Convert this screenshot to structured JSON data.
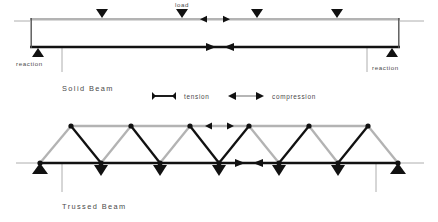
{
  "figure": {
    "title_present": false,
    "background_color": "#ffffff",
    "colors": {
      "tension": "#111111",
      "compression": "#b3b3b3",
      "ground_line": "#9a9a9a",
      "text": "#4a4a4a"
    }
  },
  "solid_beam": {
    "caption": "Solid Beam",
    "load_label": "load",
    "reaction_label_left": "reaction",
    "reaction_label_right": "reaction",
    "geometry": {
      "x_left": 30,
      "x_right": 400,
      "y_top": 18,
      "y_bottom": 48
    },
    "loads": [
      {
        "x": 102,
        "label": ""
      },
      {
        "x": 182,
        "label": "load"
      },
      {
        "x": 257,
        "label": ""
      },
      {
        "x": 337,
        "label": ""
      }
    ],
    "reactions": [
      {
        "x": 38,
        "label": "reaction"
      },
      {
        "x": 392,
        "label": "reaction"
      }
    ],
    "force_indicators": [
      {
        "chord": "top",
        "type": "compression",
        "x_center": 215,
        "direction": "outward"
      },
      {
        "chord": "bottom",
        "type": "tension",
        "x_center": 215,
        "direction": "inward"
      }
    ]
  },
  "legend": {
    "items": [
      {
        "label": "tension",
        "type": "tension",
        "color": "#111111",
        "arrow_style": "inward"
      },
      {
        "label": "compression",
        "type": "compression",
        "color": "#b3b3b3",
        "arrow_style": "outward"
      }
    ]
  },
  "trussed_beam": {
    "caption": "Trussed Beam",
    "geometry": {
      "y_top_chord": 126,
      "y_bottom_chord": 163,
      "x_left_support": 40,
      "x_right_support": 398
    },
    "top_nodes_x": [
      71,
      131,
      190,
      249,
      309,
      368
    ],
    "bottom_nodes_x": [
      40,
      101,
      160,
      219,
      279,
      338,
      398
    ],
    "top_chord_type": "compression",
    "bottom_chord_type": "tension",
    "diagonals": [
      {
        "from_x": 40,
        "to_x": 71,
        "type": "compression"
      },
      {
        "from_x": 71,
        "to_x": 101,
        "type": "tension"
      },
      {
        "from_x": 101,
        "to_x": 131,
        "type": "compression"
      },
      {
        "from_x": 131,
        "to_x": 160,
        "type": "tension"
      },
      {
        "from_x": 160,
        "to_x": 190,
        "type": "compression"
      },
      {
        "from_x": 190,
        "to_x": 219,
        "type": "tension"
      },
      {
        "from_x": 219,
        "to_x": 249,
        "type": "tension"
      },
      {
        "from_x": 249,
        "to_x": 279,
        "type": "compression"
      },
      {
        "from_x": 279,
        "to_x": 309,
        "type": "tension"
      },
      {
        "from_x": 309,
        "to_x": 338,
        "type": "compression"
      },
      {
        "from_x": 338,
        "to_x": 368,
        "type": "tension"
      },
      {
        "from_x": 368,
        "to_x": 398,
        "type": "compression"
      }
    ],
    "loads_x": [
      101,
      160,
      219,
      279,
      338
    ],
    "reactions_x": [
      40,
      398
    ],
    "force_indicators": [
      {
        "chord": "top",
        "type": "compression",
        "x_center": 219,
        "direction": "outward"
      },
      {
        "chord": "bottom",
        "type": "tension",
        "x_center": 249,
        "direction": "inward"
      }
    ]
  }
}
